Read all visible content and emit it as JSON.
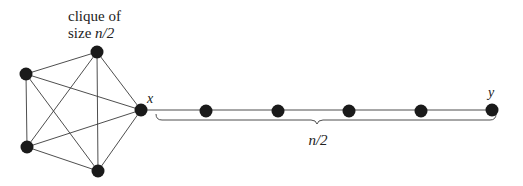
{
  "clique_label": {
    "line1": "clique of",
    "line2_prefix": "size ",
    "line2_math": "n/2"
  },
  "node_labels": {
    "x": "x",
    "y": "y"
  },
  "brace_label": "n/2",
  "graph": {
    "clique_nodes": 5,
    "path_nodes_after_x": 5,
    "node_color": "#1a1a1a",
    "edge_color": "#3a3a3a"
  }
}
